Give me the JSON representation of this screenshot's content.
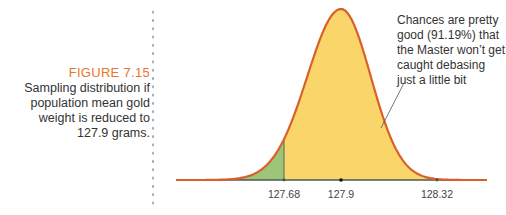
{
  "figure": {
    "label": "FIGURE 7.15",
    "caption_lines": [
      "Sampling distribution if",
      "population mean gold",
      "weight is reduced to",
      "127.9 grams."
    ]
  },
  "chart_data": {
    "type": "area",
    "title": "Sampling distribution if population mean gold weight is reduced to 127.9 grams.",
    "distribution": "normal",
    "mean": 127.9,
    "critical_values": [
      127.68,
      128.32
    ],
    "x_tick_labels": [
      "127.68",
      "127.9",
      "128.32"
    ],
    "x_ticks": [
      127.68,
      127.9,
      128.32
    ],
    "shaded_regions": [
      {
        "name": "left-tail",
        "from": null,
        "to": 127.68,
        "color": "#9cc57a"
      },
      {
        "name": "middle",
        "from": 127.68,
        "to": 128.32,
        "color": "#fad66a",
        "probability": 0.9119
      },
      {
        "name": "right-tail",
        "from": 128.32,
        "to": null,
        "color": "#9cc57a"
      }
    ],
    "curve_color": "#d9602a",
    "annotation": [
      "Chances are pretty",
      "good (91.19%) that",
      "the Master won’t get",
      "caught debasing",
      "just a little bit"
    ],
    "xlabel": "",
    "ylabel": ""
  }
}
